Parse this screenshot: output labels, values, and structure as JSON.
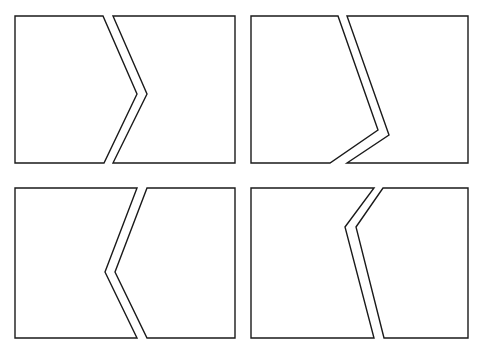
{
  "diagram": {
    "title": "",
    "stroke_color": "#1a1a1a",
    "background": "#ffffff",
    "panels": [
      {
        "id": "top-left",
        "label": "",
        "pieces": [
          {
            "name": "left-piece",
            "points": "15,16 103,16 137,94 104,163 15,163"
          },
          {
            "name": "right-piece",
            "points": "113,16 235,16 235,163 113,163 147,94"
          }
        ]
      },
      {
        "id": "top-right",
        "label": "",
        "pieces": [
          {
            "name": "left-piece",
            "points": "251,16 338,16 378,130 330,163 251,163"
          },
          {
            "name": "right-piece",
            "points": "347,16 468,16 468,163 347,163 389,135"
          }
        ]
      },
      {
        "id": "bottom-left",
        "label": "",
        "pieces": [
          {
            "name": "left-piece",
            "points": "15,188 137,188 105,272 137,338 15,338"
          },
          {
            "name": "right-piece",
            "points": "147,188 235,188 235,338 147,338 115,272"
          }
        ]
      },
      {
        "id": "bottom-right",
        "label": "",
        "pieces": [
          {
            "name": "left-piece",
            "points": "251,188 374,188 345,227 374,338 251,338"
          },
          {
            "name": "right-piece",
            "points": "383,188 468,188 468,338 384,338 356,227"
          }
        ]
      }
    ]
  }
}
